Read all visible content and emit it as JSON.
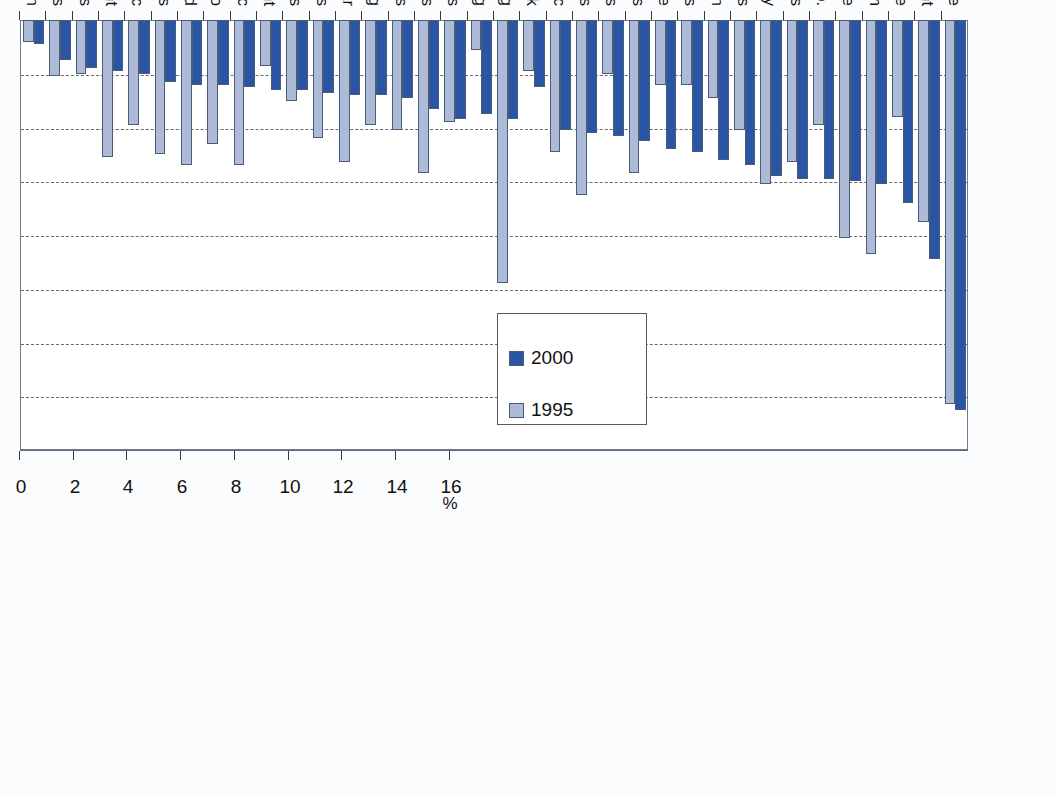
{
  "chart_data": {
    "type": "bar",
    "title": "",
    "subtitle": "",
    "xlabel": "",
    "ylabel": "",
    "unit_label": "%",
    "orientation": "vertical-bars-rotated-90",
    "grid": true,
    "gridlines_at": [
      2,
      4,
      6,
      8,
      10,
      12,
      14
    ],
    "ylim": [
      0,
      16
    ],
    "yticks": [
      0,
      2,
      4,
      6,
      8,
      10,
      12,
      14,
      16
    ],
    "ytick_labels": [
      "0",
      "2",
      "4",
      "6",
      "8",
      "10",
      "12",
      "14",
      "16"
    ],
    "legend": {
      "position": "upper-center",
      "entries": [
        "1995",
        "2000"
      ]
    },
    "categories": [
      "Transport and storage",
      "Research and development",
      "Public administration and defence",
      "Coke, refined petroleum",
      "Finance, insurance",
      "Radio, TV, communication equip.",
      "Hotels and restaurants",
      "Electricity, gas and water supply",
      "Other business activities",
      "Education",
      "Post and telecommunications",
      "Wholesale and retail trade",
      "Computer and related activities",
      "Community, social, personal services",
      "Scientific instruments",
      "Machinery and equipment nec",
      "Health and social work",
      "Mining and quarrying",
      "Agriculture, forestry and fishing",
      "Chemicals",
      "Non-metallic mineral products",
      "Office machinery and computers",
      "Paper, printing and publishing",
      "Textiles, leather and footwear",
      "Rubber and plastics",
      "Real estate activities",
      "Renting of machinery and equipment",
      "Manufacturing nec",
      "Food, beverages and tobacco",
      "Wood",
      "Fabricated metal products",
      "Electrical machinery nec",
      "Other transport equipment",
      "Motor vehicles",
      "Basic metals",
      "Construction"
    ],
    "series": [
      {
        "name": "2000",
        "color": "#2a55a5",
        "values": [
          14.5,
          8.9,
          6.8,
          6.1,
          6.0,
          5.9,
          5.9,
          5.8,
          5.4,
          5.2,
          4.9,
          4.8,
          4.5,
          4.3,
          4.2,
          4.1,
          2.5,
          3.7,
          3.5,
          3.7,
          3.3,
          2.9,
          2.8,
          2.8,
          2.7,
          2.6,
          2.6,
          2.5,
          2.4,
          2.4,
          2.3,
          2.0,
          1.9,
          1.8,
          1.5,
          0.9
        ]
      },
      {
        "name": "1995",
        "color": "#aebbd8",
        "values": [
          14.3,
          7.5,
          3.6,
          8.7,
          8.1,
          3.9,
          5.3,
          6.1,
          4.1,
          2.9,
          2.4,
          2.4,
          5.7,
          2.0,
          6.5,
          4.9,
          1.9,
          9.8,
          1.1,
          3.8,
          5.7,
          4.1,
          3.9,
          5.3,
          4.4,
          3.0,
          1.7,
          5.4,
          4.6,
          5.4,
          5.0,
          3.9,
          5.1,
          2.0,
          2.1,
          0.8
        ]
      }
    ]
  }
}
